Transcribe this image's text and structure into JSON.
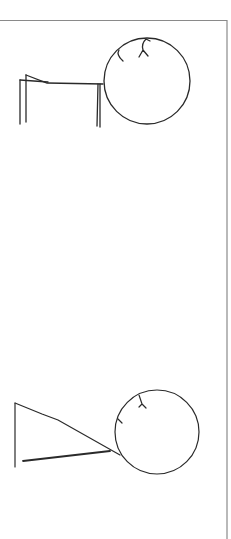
{
  "figure": {
    "stroke_color": "#2a2a2a",
    "border_color": "#8a8a8a",
    "background": "#ffffff"
  },
  "figures": [
    {
      "name": "stick-figure-top",
      "head": {
        "cx": 147,
        "cy": 81,
        "r": 43
      },
      "hair_marks": 2
    },
    {
      "name": "stick-figure-bottom",
      "head": {
        "cx": 157,
        "cy": 432,
        "r": 42
      },
      "hair_marks": 2
    }
  ]
}
